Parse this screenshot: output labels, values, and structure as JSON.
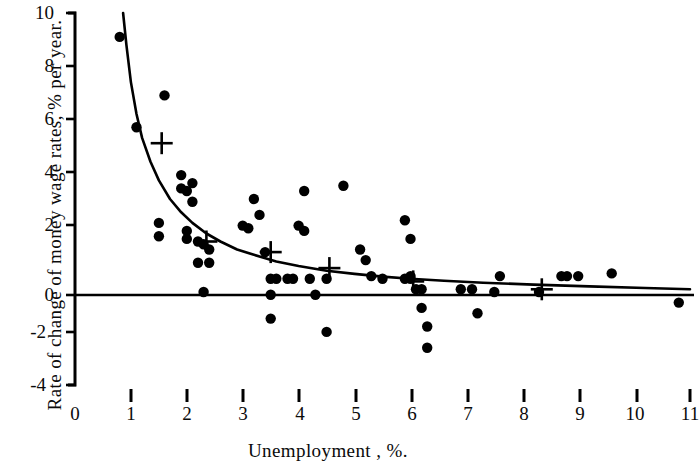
{
  "figure": {
    "kind": "scatter-plot",
    "background_color": "#ffffff",
    "ink_color": "#000000"
  },
  "axes": {
    "x_axis_label": "Unemployment , %.",
    "y_axis_label": "Rate of change of money wage rates,  % per year.",
    "x_ticks": [
      "0",
      "1",
      "2",
      "3",
      "4",
      "5",
      "6",
      "7",
      "8",
      "9",
      "10",
      "11"
    ],
    "y_ticks": [
      "10",
      "8",
      "6",
      "4",
      "2",
      "0",
      "-2",
      "-4"
    ]
  },
  "chart_data": {
    "type": "scatter",
    "title": "",
    "subtitle": "",
    "xlabel": "Unemployment , %.",
    "ylabel": "Rate of change of money wage rates,  % per year.",
    "xlim": [
      0,
      11
    ],
    "ylim": [
      -4,
      10
    ],
    "xticks": [
      0,
      1,
      2,
      3,
      4,
      5,
      6,
      7,
      8,
      9,
      10,
      11
    ],
    "yticks": [
      -4,
      -2,
      0,
      2,
      4,
      6,
      8,
      10
    ],
    "grid": false,
    "legend": null,
    "series": [
      {
        "name": "Annual observations",
        "marker": "filled-circle",
        "points": [
          [
            0.8,
            9.1
          ],
          [
            1.1,
            5.7
          ],
          [
            1.6,
            6.9
          ],
          [
            1.5,
            2.1
          ],
          [
            1.9,
            3.9
          ],
          [
            1.9,
            3.4
          ],
          [
            2.0,
            3.3
          ],
          [
            2.1,
            3.6
          ],
          [
            2.1,
            2.9
          ],
          [
            2.0,
            1.8
          ],
          [
            2.0,
            1.5
          ],
          [
            2.2,
            1.4
          ],
          [
            2.3,
            1.3
          ],
          [
            2.4,
            1.1
          ],
          [
            2.2,
            0.6
          ],
          [
            2.4,
            0.6
          ],
          [
            2.3,
            -0.5
          ],
          [
            1.5,
            1.6
          ],
          [
            3.0,
            2.0
          ],
          [
            3.1,
            1.9
          ],
          [
            3.2,
            3.0
          ],
          [
            3.3,
            2.4
          ],
          [
            3.4,
            1.0
          ],
          [
            3.5,
            0.0
          ],
          [
            3.6,
            0.0
          ],
          [
            3.5,
            -0.6
          ],
          [
            3.5,
            -1.5
          ],
          [
            3.8,
            0.0
          ],
          [
            3.9,
            0.0
          ],
          [
            4.0,
            2.0
          ],
          [
            4.1,
            1.8
          ],
          [
            4.1,
            3.3
          ],
          [
            4.2,
            0.0
          ],
          [
            4.3,
            -0.6
          ],
          [
            4.5,
            0.0
          ],
          [
            4.5,
            -2.0
          ],
          [
            4.8,
            3.5
          ],
          [
            5.1,
            1.1
          ],
          [
            5.2,
            0.7
          ],
          [
            5.3,
            0.1
          ],
          [
            5.5,
            0.0
          ],
          [
            5.9,
            0.0
          ],
          [
            6.0,
            0.0
          ],
          [
            6.0,
            0.1
          ],
          [
            6.1,
            -0.4
          ],
          [
            6.2,
            -0.4
          ],
          [
            6.2,
            -1.1
          ],
          [
            6.3,
            -1.8
          ],
          [
            6.3,
            -2.6
          ],
          [
            5.9,
            2.2
          ],
          [
            6.0,
            1.5
          ],
          [
            6.9,
            -0.4
          ],
          [
            7.1,
            -0.4
          ],
          [
            7.2,
            -1.3
          ],
          [
            7.5,
            -0.5
          ],
          [
            7.6,
            0.1
          ],
          [
            8.3,
            -0.5
          ],
          [
            8.7,
            0.1
          ],
          [
            8.8,
            0.1
          ],
          [
            9.0,
            0.1
          ],
          [
            9.6,
            0.2
          ],
          [
            10.8,
            -0.9
          ]
        ]
      },
      {
        "name": "Fitted group means",
        "marker": "plus-cross",
        "points": [
          [
            1.55,
            5.1
          ],
          [
            2.35,
            1.4
          ],
          [
            3.5,
            1.0
          ],
          [
            4.55,
            0.4
          ],
          [
            6.05,
            -0.1
          ],
          [
            8.35,
            -0.4
          ]
        ]
      }
    ],
    "curves": [
      {
        "name": "fitted Phillips curve",
        "style": "solid",
        "description": "Downward-sloping hyperbolic fit passing from about (0.85, 10) steeply down through (2.0, 2.5) to an asymptote slightly below zero on the right.",
        "points": [
          [
            0.86,
            10.0
          ],
          [
            0.92,
            8.8
          ],
          [
            1.0,
            7.4
          ],
          [
            1.1,
            6.2
          ],
          [
            1.2,
            5.3
          ],
          [
            1.35,
            4.4
          ],
          [
            1.5,
            3.7
          ],
          [
            1.7,
            3.0
          ],
          [
            1.9,
            2.5
          ],
          [
            2.1,
            2.1
          ],
          [
            2.35,
            1.7
          ],
          [
            2.6,
            1.4
          ],
          [
            2.9,
            1.1
          ],
          [
            3.2,
            0.9
          ],
          [
            3.6,
            0.65
          ],
          [
            4.0,
            0.48
          ],
          [
            4.5,
            0.3
          ],
          [
            5.0,
            0.18
          ],
          [
            5.5,
            0.08
          ],
          [
            6.0,
            0.0
          ],
          [
            6.6,
            -0.08
          ],
          [
            7.3,
            -0.15
          ],
          [
            8.2,
            -0.22
          ],
          [
            9.2,
            -0.29
          ],
          [
            10.2,
            -0.35
          ],
          [
            11.0,
            -0.4
          ]
        ]
      },
      {
        "name": "zero-line",
        "style": "solid",
        "description": "Horizontal axis drawn at y = 0 across the full plot width.",
        "points": [
          [
            0,
            0
          ],
          [
            11,
            0
          ]
        ]
      }
    ]
  }
}
